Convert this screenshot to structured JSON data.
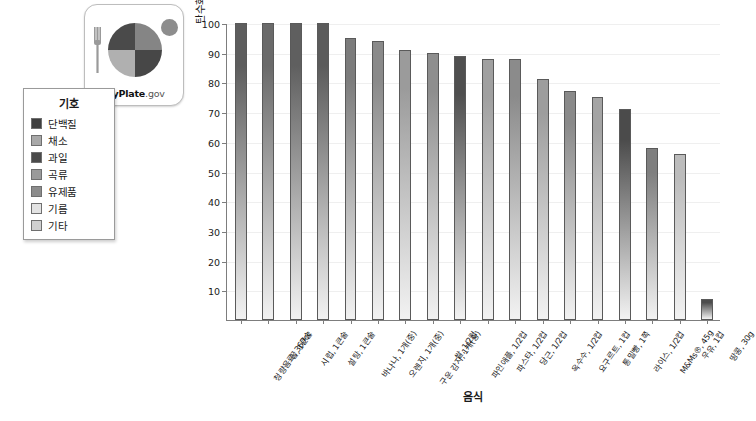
{
  "logo": {
    "name": "myplate-logo",
    "wordmark_bold": "MyPlate",
    "wordmark_suffix": ".gov",
    "fork_icon": "fork-icon",
    "plate_icon": "plate-icon",
    "cup_icon": "cup-icon",
    "quadrant_colors": [
      "#4a4a4a",
      "#858585",
      "#b0b0b0",
      "#474747"
    ],
    "cup_color": "#8d8d8d",
    "fork_color": "#9a9a9a"
  },
  "legend": {
    "title": "기호",
    "items": [
      {
        "label": "단백질",
        "color": "#3f3f3f"
      },
      {
        "label": "채소",
        "color": "#a8a8a8"
      },
      {
        "label": "과일",
        "color": "#4a4a4a"
      },
      {
        "label": "곡류",
        "color": "#9a9a9a"
      },
      {
        "label": "유제품",
        "color": "#8c8c8c"
      },
      {
        "label": "기름",
        "color": "#e3e3e3"
      },
      {
        "label": "기타",
        "color": "#cfcfcf"
      }
    ]
  },
  "chart_data": {
    "type": "bar",
    "title": "",
    "xlabel": "음식",
    "ylabel": "탄수화물의 에너지(%)",
    "ylim": [
      0,
      100
    ],
    "yticks": [
      10,
      20,
      30,
      40,
      50,
      60,
      70,
      80,
      90,
      100
    ],
    "grid": true,
    "legend_position": "left-outside",
    "categories": [
      "청량음료, 360cc",
      "꿀, 1큰술",
      "시럽, 1큰술",
      "설탕, 1큰술",
      "바나나, 1개(중)",
      "오렌지, 1개(중)",
      "구운 감자, 1개(중)",
      "쌀, 1/2컵",
      "파인애플, 1/2컵",
      "파스타, 1/2컵",
      "당근, 1/2컵",
      "옥수수, 1/2컵",
      "요구르트, 1컵",
      "통밀빵, 1쪽",
      "라이스, 1/2컵",
      "M&Ms®, 45g",
      "우유, 1컵",
      "땅콩, 30g"
    ],
    "values": [
      100,
      100,
      100,
      100,
      95,
      94,
      91,
      90,
      89,
      88,
      88,
      81,
      77,
      75,
      71,
      58,
      56,
      7
    ],
    "group": [
      "기타",
      "기타",
      "기타",
      "기타",
      "과일",
      "과일",
      "채소",
      "곡류",
      "과일",
      "곡류",
      "채소",
      "채소",
      "유제품",
      "곡류",
      "곡류",
      "기타",
      "유제품",
      "단백질"
    ],
    "bar_colors": [
      "#5d5d5d",
      "#6a6a6a",
      "#5f5f5f",
      "#5b5b5b",
      "#7c7c7c",
      "#8a8a8a",
      "#9b9b9b",
      "#8e8e8e",
      "#4f4f4f",
      "#a0a0a0",
      "#8b8b8b",
      "#9d9d9d",
      "#8a8a8a",
      "#a4a4a4",
      "#4b4b4b",
      "#7f7f7f",
      "#bcbcbc",
      "#4d4d4d"
    ]
  }
}
